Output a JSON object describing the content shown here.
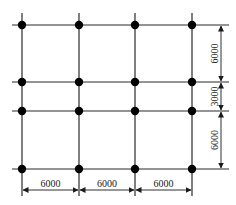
{
  "diagram": {
    "type": "structural-column-grid",
    "columns": 4,
    "rows": 4,
    "colors": {
      "line": "#2a2a2a",
      "node": "#000000",
      "background": "#ffffff"
    },
    "horizontal_dimensions": [
      {
        "label": "6000"
      },
      {
        "label": "6000"
      },
      {
        "label": "6000"
      }
    ],
    "vertical_dimensions": [
      {
        "label": "6000"
      },
      {
        "label": "3000"
      },
      {
        "label": "6000"
      }
    ]
  }
}
